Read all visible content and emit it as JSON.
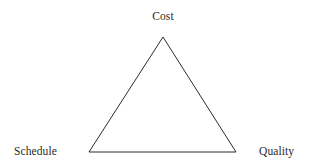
{
  "diagram": {
    "type": "triangle-diagram",
    "name": "project-management-triangle",
    "background_color": "#ffffff",
    "stroke_color": "#2b2b2b",
    "stroke_width": 1,
    "fill": "none",
    "canvas": {
      "width": 312,
      "height": 164
    },
    "vertices": [
      {
        "id": "apex",
        "label": "Cost",
        "x": 163,
        "y": 37,
        "label_x": 163,
        "label_y": 16,
        "label_anchor": "middle"
      },
      {
        "id": "bottom-left",
        "label": "Schedule",
        "x": 89,
        "y": 152,
        "label_x": 14,
        "label_y": 151,
        "label_anchor": "start"
      },
      {
        "id": "bottom-right",
        "label": "Quality",
        "x": 236,
        "y": 152,
        "label_x": 259,
        "label_y": 151,
        "label_anchor": "start"
      }
    ],
    "edges": [
      {
        "from": "bottom-left",
        "to": "apex"
      },
      {
        "from": "apex",
        "to": "bottom-right"
      },
      {
        "from": "bottom-right",
        "to": "bottom-left"
      }
    ],
    "points_attr": "163,37 236,152 89,152"
  },
  "labels": {
    "cost": "Cost",
    "schedule": "Schedule",
    "quality": "Quality"
  }
}
